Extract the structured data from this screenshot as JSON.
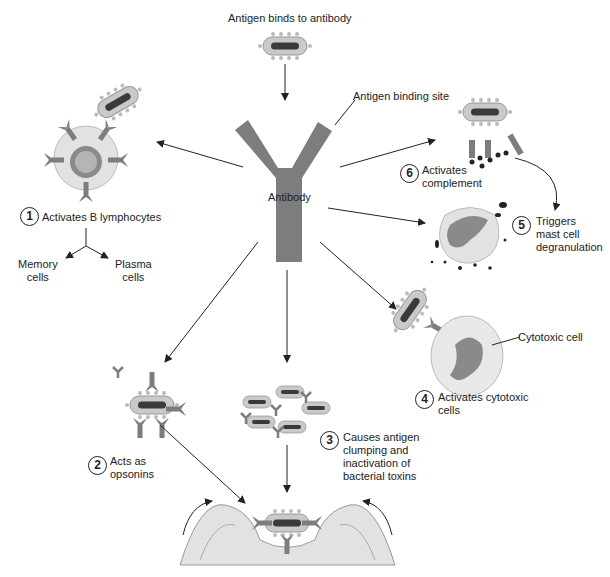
{
  "title": "Antigen binds to antibody",
  "labels": {
    "binding_site": "Antigen binding site",
    "antibody": "Antibody",
    "memory": "Memory\ncells",
    "plasma": "Plasma\ncells",
    "cytotoxic_cell": "Cytotoxic cell"
  },
  "functions": [
    {
      "num": "1",
      "text": "Activates B lymphocytes"
    },
    {
      "num": "2",
      "text": "Acts as\nopsonins"
    },
    {
      "num": "3",
      "text": "Causes antigen\nclumping and\ninactivation of\nbacterial toxins"
    },
    {
      "num": "4",
      "text": "Activates cytotoxic\ncells"
    },
    {
      "num": "5",
      "text": "Triggers\nmast cell\ndegranulation"
    },
    {
      "num": "6",
      "text": "Activates\ncomplement"
    }
  ],
  "colors": {
    "antibody": "#7d7d7d",
    "bacterium_fill": "#c9c9c9",
    "bacterium_core": "#3a3a3a",
    "cell_fill": "#e2e2e2",
    "nucleus": "#8a8a8a",
    "line": "#222222"
  }
}
